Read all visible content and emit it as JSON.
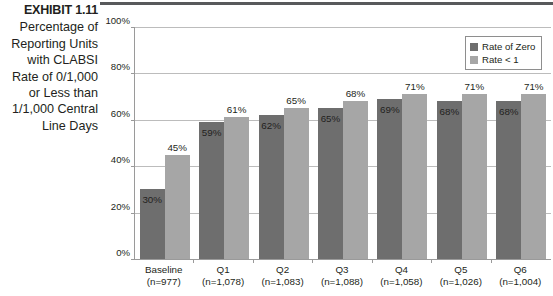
{
  "exhibit": {
    "number": "EXHIBIT 1.11",
    "caption_lines": [
      "Percentage of",
      "Reporting Units",
      "with CLABSI",
      "Rate of 0/1,000",
      "or Less than",
      "1/1,000 Central",
      "Line Days"
    ]
  },
  "legend": {
    "items": [
      {
        "label": "Rate of Zero",
        "color": "#6e6e6e"
      },
      {
        "label": "Rate < 1",
        "color": "#a6a6a6"
      }
    ]
  },
  "axis": {
    "y_ticks": [
      "0%",
      "20%",
      "40%",
      "60%",
      "80%",
      "100%"
    ]
  },
  "chart_data": {
    "type": "bar",
    "title": "Percentage of Reporting Units with CLABSI Rate of 0/1,000 or Less than 1/1,000 Central Line Days",
    "categories": [
      "Baseline",
      "Q1",
      "Q2",
      "Q3",
      "Q4",
      "Q5",
      "Q6"
    ],
    "category_sublabels": [
      "(n=977)",
      "(n=1,078)",
      "(n=1,083)",
      "(n=1,088)",
      "(n=1,058)",
      "(n=1,026)",
      "(n=1,004)"
    ],
    "series": [
      {
        "name": "Rate of Zero",
        "color": "#6e6e6e",
        "values": [
          30,
          59,
          62,
          65,
          69,
          68,
          68
        ],
        "labels": [
          "30%",
          "59%",
          "62%",
          "65%",
          "69%",
          "68%",
          "68%"
        ]
      },
      {
        "name": "Rate < 1",
        "color": "#a6a6a6",
        "values": [
          45,
          61,
          65,
          68,
          71,
          71,
          71
        ],
        "labels": [
          "45%",
          "61%",
          "65%",
          "68%",
          "71%",
          "71%",
          "71%"
        ]
      }
    ],
    "xlabel": "",
    "ylabel": "",
    "ylim": [
      0,
      100
    ],
    "ytick_step": 20,
    "grid": true,
    "legend_position": "top-right"
  }
}
